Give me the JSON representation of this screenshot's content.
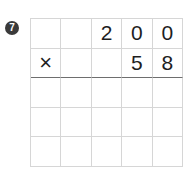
{
  "problem": {
    "number_badge": "7",
    "operator": "×",
    "multiplicand_digits": [
      "",
      "",
      "2",
      "0",
      "0"
    ],
    "multiplier_digits": [
      "×",
      "",
      "",
      "5",
      "8"
    ],
    "work_rows": [
      [
        "",
        "",
        "",
        "",
        ""
      ],
      [
        "",
        "",
        "",
        "",
        ""
      ],
      [
        "",
        "",
        "",
        "",
        ""
      ]
    ]
  }
}
